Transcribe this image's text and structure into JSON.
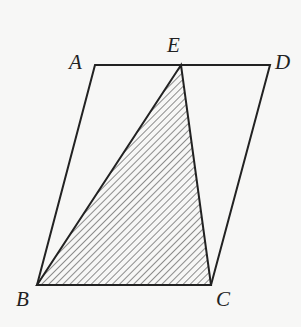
{
  "figure": {
    "type": "parallelogram with shaded triangle",
    "points": {
      "A": {
        "label": "A",
        "x": 95,
        "y": 65
      },
      "E": {
        "label": "E",
        "x": 181,
        "y": 65
      },
      "D": {
        "label": "D",
        "x": 270,
        "y": 65
      },
      "B": {
        "label": "B",
        "x": 37,
        "y": 285
      },
      "C": {
        "label": "C",
        "x": 211,
        "y": 285
      }
    },
    "shaded_region": "triangle EBC",
    "colors": {
      "stroke": "#222222",
      "background": "#f7f7f6"
    }
  }
}
